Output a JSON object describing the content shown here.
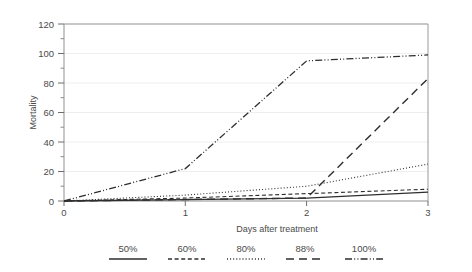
{
  "chart_data": {
    "type": "line",
    "title": "",
    "xlabel": "Days after treatment",
    "ylabel": "Mortality",
    "x": [
      0,
      1,
      2,
      3
    ],
    "xlim": [
      0,
      3
    ],
    "ylim": [
      0,
      120
    ],
    "xticks": [
      "0",
      "1",
      "2",
      "3"
    ],
    "yticks": [
      "0",
      "20",
      "40",
      "60",
      "80",
      "100",
      "120"
    ],
    "grid": true,
    "legend_position": "bottom",
    "series": [
      {
        "name": "50%",
        "values": [
          0,
          1,
          2,
          6
        ],
        "style": "solid",
        "color": "#2e2e2e"
      },
      {
        "name": "60%",
        "values": [
          0,
          2,
          5,
          8
        ],
        "style": "dashed",
        "color": "#2e2e2e"
      },
      {
        "name": "80%",
        "values": [
          0,
          4,
          10,
          25
        ],
        "style": "dotted",
        "color": "#2e2e2e"
      },
      {
        "name": "88%",
        "values": [
          0,
          1,
          2,
          83
        ],
        "style": "long-dash",
        "color": "#2e2e2e"
      },
      {
        "name": "100%",
        "values": [
          0,
          22,
          95,
          99
        ],
        "style": "dash-dot-dot",
        "color": "#2e2e2e"
      }
    ]
  },
  "axes": {
    "ylabel": "Mortality",
    "xlabel": "Days after treatment",
    "yticks": [
      "120",
      "100",
      "80",
      "60",
      "40",
      "20",
      "0"
    ],
    "xticks": [
      "0",
      "1",
      "2",
      "3"
    ]
  },
  "legend": {
    "items": [
      {
        "label": "50%"
      },
      {
        "label": "60%"
      },
      {
        "label": "80%"
      },
      {
        "label": "88%"
      },
      {
        "label": "100%"
      }
    ]
  },
  "colors": {
    "line": "#2e2e2e",
    "frame": "#9a9a9a",
    "grid": "#e8e8e8",
    "text": "#4a4a4a",
    "background": "#ffffff"
  }
}
